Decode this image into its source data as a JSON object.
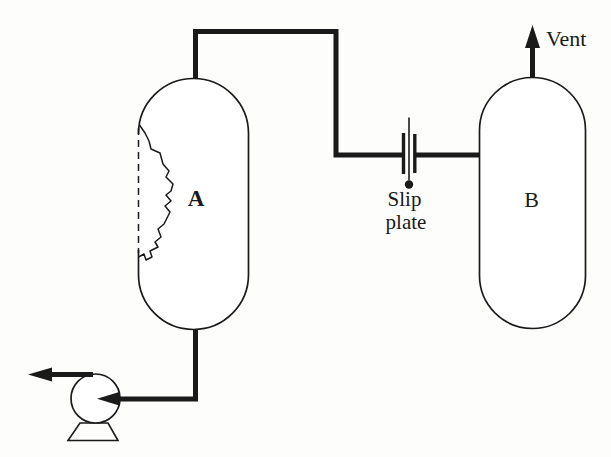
{
  "colors": {
    "ink": "#1a1a1a",
    "paper": "#fdfdfc"
  },
  "labels": {
    "vessel_a": "A",
    "vessel_b": "B",
    "slip_plate_line1": "Slip",
    "slip_plate_line2": "plate",
    "vent": "Vent"
  }
}
